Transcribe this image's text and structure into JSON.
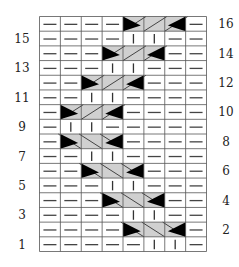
{
  "colors": {
    "grid_line": "#555555",
    "purl_dash": "#444444",
    "knit_bar": "#333333",
    "cable_fill": "#d0d0d0",
    "cable_edge": "#333333",
    "triangle": "#000000",
    "background": "#ffffff"
  },
  "legend_symbols": {
    "P": "purl (horizontal dash)",
    "K": "knit (vertical bar)",
    "CL": "3-stitch cable crossing, slanting up-right",
    "CR": "3-stitch cable crossing, slanting down-right"
  },
  "columns": 8,
  "rows": [
    {
      "row": 16,
      "label": "16",
      "label_side": "right",
      "cells": "PPPP",
      "cable": {
        "type": "CL",
        "start_col": 5
      }
    },
    {
      "row": 15,
      "label": "15",
      "label_side": "left",
      "cells": "PPPPKKPP"
    },
    {
      "row": 14,
      "label": "14",
      "label_side": "right",
      "cells": "PPP",
      "cable": {
        "type": "CL",
        "start_col": 4
      }
    },
    {
      "row": 13,
      "label": "13",
      "label_side": "left",
      "cells": "PPPKKPPP"
    },
    {
      "row": 12,
      "label": "12",
      "label_side": "right",
      "cells": "PP",
      "cable": {
        "type": "CL",
        "start_col": 3
      }
    },
    {
      "row": 11,
      "label": "11",
      "label_side": "left",
      "cells": "PPKKPPPP"
    },
    {
      "row": 10,
      "label": "10",
      "label_side": "right",
      "cells": "P",
      "cable": {
        "type": "CL",
        "start_col": 2
      }
    },
    {
      "row": 9,
      "label": "9",
      "label_side": "left",
      "cells": "PKKPPPPP"
    },
    {
      "row": 8,
      "label": "8",
      "label_side": "right",
      "cells": "P",
      "cable": {
        "type": "CR",
        "start_col": 2
      }
    },
    {
      "row": 7,
      "label": "7",
      "label_side": "left",
      "cells": "PPKKPPPP"
    },
    {
      "row": 6,
      "label": "6",
      "label_side": "right",
      "cells": "PP",
      "cable": {
        "type": "CR",
        "start_col": 3
      }
    },
    {
      "row": 5,
      "label": "5",
      "label_side": "left",
      "cells": "PPPKKPPP"
    },
    {
      "row": 4,
      "label": "4",
      "label_side": "right",
      "cells": "PPP",
      "cable": {
        "type": "CR",
        "start_col": 4
      }
    },
    {
      "row": 3,
      "label": "3",
      "label_side": "left",
      "cells": "PPPPKKPP"
    },
    {
      "row": 2,
      "label": "2",
      "label_side": "right",
      "cells": "PPPP",
      "cable": {
        "type": "CR",
        "start_col": 5
      }
    },
    {
      "row": 1,
      "label": "1",
      "label_side": "left",
      "cells": "PPPPPKKP"
    }
  ]
}
